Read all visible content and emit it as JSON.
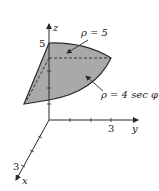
{
  "figure": {
    "axes": {
      "z_label": "z",
      "y_label": "y",
      "x_label": "x",
      "z_tick_label": "5",
      "y_tick_label": "3",
      "x_tick_label": "3"
    },
    "annotations": [
      {
        "text": "ρ = 5",
        "target": "spherical cap (top surface)"
      },
      {
        "text": "ρ = 4 sec φ",
        "target": "plane z = 4 (shaded region)"
      }
    ],
    "colors": {
      "region_fill": "#a9a9a9",
      "stroke": "#2a2a2a",
      "background": "#ffffff"
    }
  }
}
